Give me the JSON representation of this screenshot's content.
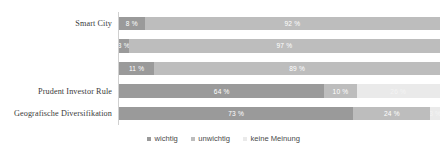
{
  "chart_data": {
    "type": "bar",
    "orientation": "horizontal",
    "stacked": true,
    "stack_mode": "percent",
    "title": "",
    "xlabel": "",
    "ylabel": "",
    "xlim": [
      0,
      100
    ],
    "grid": false,
    "legend_position": "bottom",
    "categories": [
      "Smart City",
      "",
      "",
      "Prudent Investor Rule",
      "Geografische Diversifikation"
    ],
    "series": [
      {
        "name": "wichtig",
        "color": "#9a9a9a",
        "values": [
          8,
          3,
          11,
          64,
          73
        ]
      },
      {
        "name": "unwichtig",
        "color": "#bdbdbd",
        "values": [
          92,
          97,
          89,
          10,
          24
        ]
      },
      {
        "name": "keine Meinung",
        "color": "#eaeaea",
        "values": [
          0,
          0,
          0,
          26,
          3
        ]
      }
    ],
    "data_labels": [
      [
        "8 %",
        "92 %",
        ""
      ],
      [
        "3 %",
        "97 %",
        ""
      ],
      [
        "11 %",
        "89 %",
        ""
      ],
      [
        "64 %",
        "10 %",
        "26 %"
      ],
      [
        "73 %",
        "24 %",
        "3 %"
      ]
    ]
  },
  "legend": {
    "items": [
      {
        "label": "wichtig"
      },
      {
        "label": "unwichtig"
      },
      {
        "label": "keine Meinung"
      }
    ]
  }
}
